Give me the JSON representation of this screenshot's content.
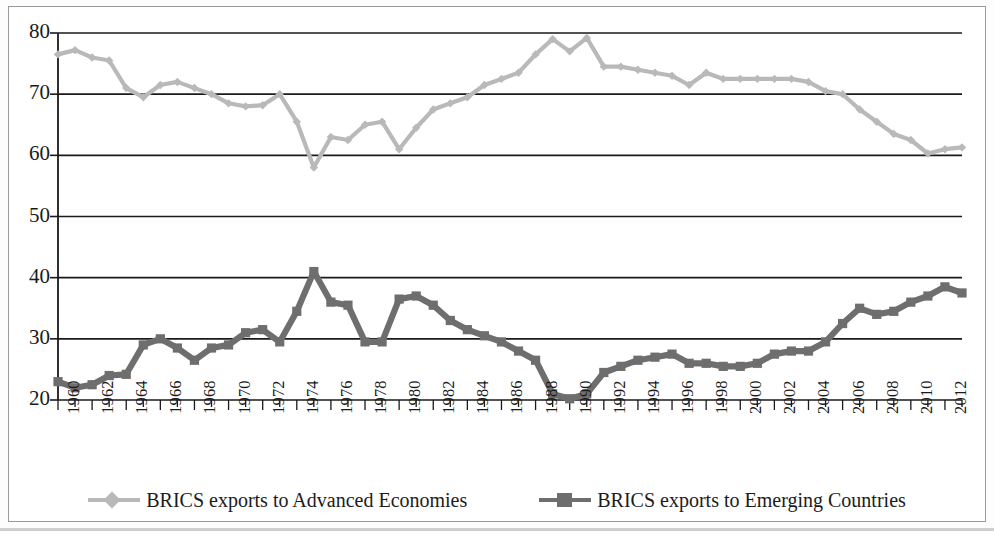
{
  "chart_data": {
    "type": "line",
    "title": "",
    "subtitle": "",
    "xlabel": "",
    "ylabel": "",
    "xlim": [
      1960,
      2013
    ],
    "ylim": [
      20,
      80
    ],
    "ytick_step": 10,
    "grid": "horizontal",
    "legend_position": "bottom",
    "yticks": [
      20,
      30,
      40,
      50,
      60,
      70,
      80
    ],
    "xticks": [
      1960,
      1962,
      1964,
      1966,
      1968,
      1970,
      1972,
      1974,
      1976,
      1978,
      1980,
      1982,
      1984,
      1986,
      1988,
      1990,
      1992,
      1994,
      1996,
      1998,
      2000,
      2002,
      2004,
      2006,
      2008,
      2010,
      2012
    ],
    "x": [
      1960,
      1961,
      1962,
      1963,
      1964,
      1965,
      1966,
      1967,
      1968,
      1969,
      1970,
      1971,
      1972,
      1973,
      1974,
      1975,
      1976,
      1977,
      1978,
      1979,
      1980,
      1981,
      1982,
      1983,
      1984,
      1985,
      1986,
      1987,
      1988,
      1989,
      1990,
      1991,
      1992,
      1993,
      1994,
      1995,
      1996,
      1997,
      1998,
      1999,
      2000,
      2001,
      2002,
      2003,
      2004,
      2005,
      2006,
      2007,
      2008,
      2009,
      2010,
      2011,
      2012,
      2013
    ],
    "series": [
      {
        "name": "BRICS exports to Advanced Economies",
        "color": "#b9b9b9",
        "marker": "diamond",
        "values": [
          76.5,
          77.2,
          76.0,
          75.5,
          71.0,
          69.5,
          71.5,
          72.0,
          71.0,
          70.0,
          68.5,
          68.0,
          68.2,
          70.0,
          65.5,
          58.0,
          63.0,
          62.5,
          65.0,
          65.5,
          61.0,
          64.5,
          67.5,
          68.5,
          69.5,
          71.5,
          72.5,
          73.5,
          76.5,
          79.0,
          77.0,
          79.2,
          74.5,
          74.5,
          74.0,
          73.5,
          73.0,
          71.5,
          73.5,
          72.5,
          72.5,
          72.5,
          72.5,
          72.5,
          72.0,
          70.5,
          70.0,
          67.5,
          65.5,
          63.5,
          62.5,
          60.3,
          61.0,
          61.3
        ]
      },
      {
        "name": "BRICS exports to Emerging Countries",
        "color": "#6e6e6e",
        "marker": "square",
        "values": [
          23.0,
          22.0,
          22.5,
          24.0,
          24.2,
          29.0,
          30.0,
          28.5,
          26.5,
          28.5,
          29.0,
          31.0,
          31.5,
          29.5,
          34.5,
          41.0,
          36.0,
          35.5,
          29.5,
          29.5,
          36.5,
          37.0,
          35.5,
          33.0,
          31.5,
          30.5,
          29.5,
          28.0,
          26.5,
          21.0,
          20.2,
          21.0,
          24.5,
          25.5,
          26.5,
          27.0,
          27.5,
          26.0,
          26.0,
          25.5,
          25.5,
          26.0,
          27.5,
          28.0,
          28.0,
          29.5,
          32.5,
          35.0,
          34.0,
          34.5,
          36.0,
          37.0,
          38.5,
          37.5
        ]
      }
    ]
  },
  "legend": {
    "entries": [
      {
        "label": "BRICS exports to Advanced Economies",
        "marker": "diamond-marker",
        "color": "#b9b9b9"
      },
      {
        "label": "BRICS exports to Emerging Countries",
        "marker": "square-marker",
        "color": "#6e6e6e"
      }
    ]
  }
}
